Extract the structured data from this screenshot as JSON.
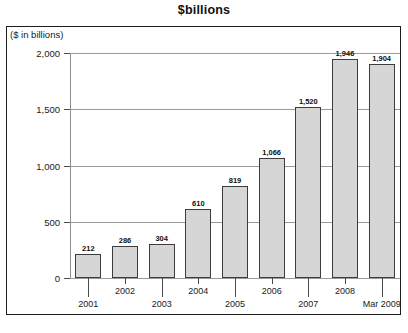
{
  "chart_data": {
    "type": "bar",
    "title": "$billions",
    "xlabel": "",
    "ylabel": "($ in billions)",
    "categories": [
      "2001",
      "2002",
      "2003",
      "2004",
      "2005",
      "2006",
      "2007",
      "2008",
      "Mar 2009"
    ],
    "values": [
      212,
      286,
      304,
      610,
      819,
      1066,
      1520,
      1946,
      1904
    ],
    "value_labels": [
      "212",
      "286",
      "304",
      "610",
      "819",
      "1,066",
      "1,520",
      "1,946",
      "1,904"
    ],
    "ylim": [
      0,
      2000
    ],
    "yticks": [
      0,
      500,
      1000,
      1500,
      2000
    ],
    "ytick_labels": [
      "0",
      "500",
      "1,000",
      "1,500",
      "2,000"
    ],
    "grid": true,
    "legend": "none",
    "bar_fill_color": "#d6d6d6",
    "bar_border_color": "#3c3c3c",
    "frame_color": "#1d1d1d",
    "gridline_color": "#9a9a9a"
  }
}
